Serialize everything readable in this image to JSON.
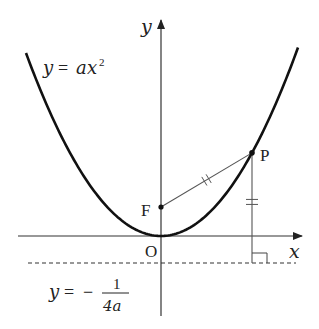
{
  "diagram": {
    "axes": {
      "x_label": "x",
      "y_label": "y",
      "origin_label": "O"
    },
    "curve_label": {
      "lhs": "y",
      "eq": "=",
      "rhs_coef": "a",
      "rhs_var": "x",
      "rhs_exp": "2"
    },
    "directrix_label": {
      "lhs": "y",
      "eq": "=",
      "sign": "−",
      "numerator": "1",
      "denominator": "4a"
    },
    "points": {
      "focus": "F",
      "point": "P"
    },
    "equal_marks": "||",
    "colors": {
      "curve": "#111111",
      "axis": "#333333",
      "segment": "#555555",
      "text": "#222222"
    }
  }
}
